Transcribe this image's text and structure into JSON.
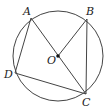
{
  "diagram": {
    "type": "geometry",
    "circle": {
      "center": "O",
      "cx": 58,
      "cy": 56,
      "r": 45
    },
    "points": {
      "A": {
        "label": "A",
        "x": 31,
        "y": 18
      },
      "B": {
        "label": "B",
        "x": 87,
        "y": 19
      },
      "C": {
        "label": "C",
        "x": 86,
        "y": 94
      },
      "D": {
        "label": "D",
        "x": 15,
        "y": 73
      },
      "O": {
        "label": "O",
        "x": 58,
        "y": 56
      }
    },
    "segments": [
      [
        "A",
        "C"
      ],
      [
        "O",
        "B"
      ],
      [
        "B",
        "C"
      ],
      [
        "A",
        "D"
      ],
      [
        "D",
        "C"
      ]
    ],
    "colors": {
      "stroke": "#333333",
      "background": "#ffffff"
    }
  }
}
